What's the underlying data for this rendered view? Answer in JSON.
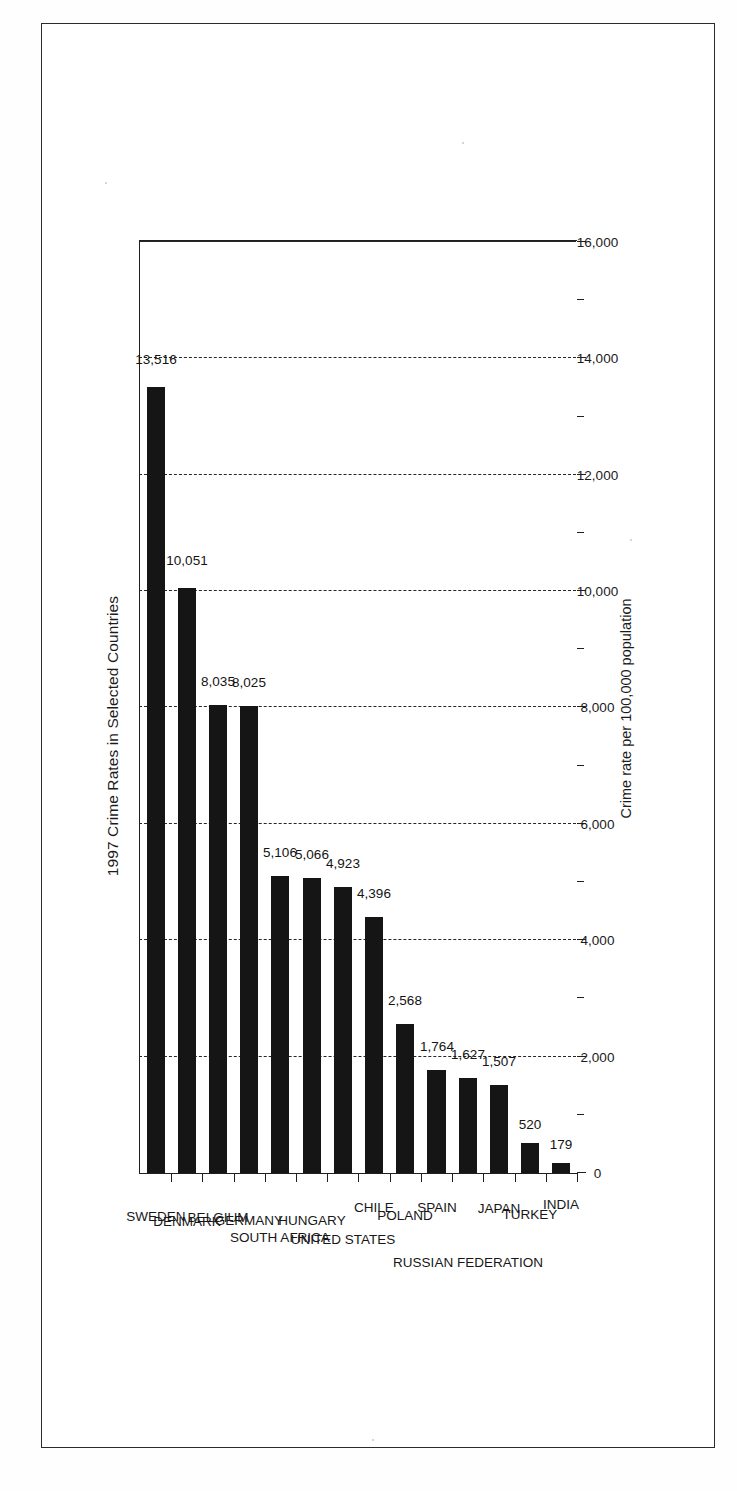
{
  "document": {
    "kind": "scanned-figure-page",
    "frame_color": "#2b2b2b",
    "background": "#ffffff"
  },
  "chart_data": {
    "type": "bar",
    "orientation": "vertical-rotated-90",
    "title": "1997 Crime Rates in Selected Countries",
    "xlabel": "",
    "ylabel": "Crime rate per 100,000 population",
    "ylim": [
      0,
      16000
    ],
    "ytick_step": 2000,
    "minor_tick_step": 1000,
    "grid": "dashed-horizontal-at-major-ticks",
    "legend": null,
    "bar_color": "#151515",
    "value_labels": true,
    "categories": [
      "SWEDEN",
      "DENMARK",
      "BELGIUM",
      "GERMANY",
      "SOUTH AFRICA",
      "HUNGARY",
      "UNITED STATES",
      "CHILE",
      "POLAND",
      "SPAIN",
      "RUSSIAN FEDERATION",
      "JAPAN",
      "TURKEY",
      "INDIA"
    ],
    "values": [
      13516,
      10051,
      8035,
      8025,
      5106,
      5066,
      4923,
      4396,
      2568,
      1764,
      1627,
      1507,
      520,
      179
    ],
    "value_label_text": [
      "13,516",
      "10,051",
      "8,035",
      "8,025",
      "5,106",
      "5,066",
      "4,923",
      "4,396",
      "2,568",
      "1,764",
      "1,627",
      "1,507",
      "520",
      "179"
    ],
    "ytick_labels": [
      "0",
      "2,000",
      "4,000",
      "6,000",
      "8,000",
      "10,000",
      "12,000",
      "14,000",
      "16,000"
    ],
    "ytick_values": [
      0,
      2000,
      4000,
      6000,
      8000,
      10000,
      12000,
      14000,
      16000
    ]
  }
}
